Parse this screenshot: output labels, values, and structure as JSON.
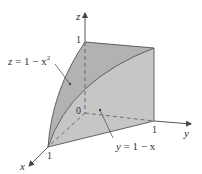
{
  "diagram": {
    "type": "3d-solid-region",
    "axes": {
      "x": {
        "label": "x",
        "tick": "1"
      },
      "y": {
        "label": "y",
        "tick": "1"
      },
      "z": {
        "label": "z",
        "tick": "1"
      },
      "origin": "0"
    },
    "surfaces": [
      {
        "id": "parabolic-cylinder",
        "equation": "z = 1 − x",
        "equation_sup": "2",
        "fill": "#b4b4b4"
      },
      {
        "id": "plane",
        "equation": "y = 1 − x",
        "fill": "#c8c8c8"
      },
      {
        "id": "back-face",
        "fill": "#a9a9a9"
      }
    ],
    "colors": {
      "axis": "#444444",
      "edge": "#555555",
      "text": "#333333",
      "background": "#ffffff"
    }
  }
}
